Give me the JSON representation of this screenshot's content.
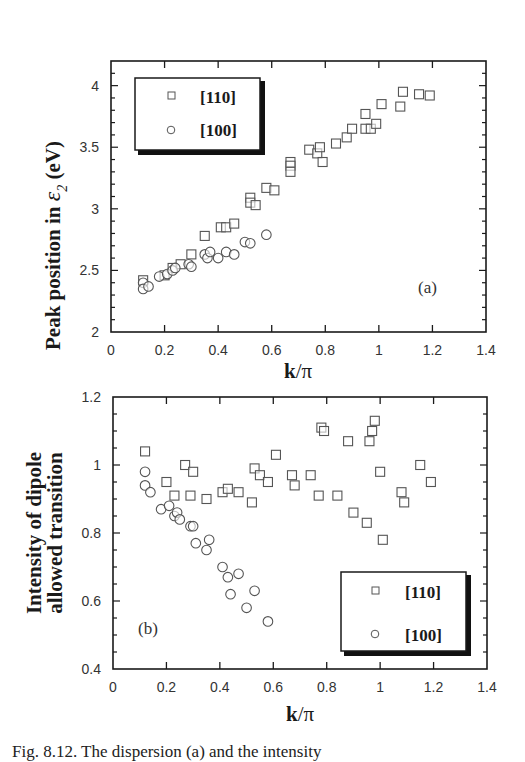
{
  "caption": "Fig. 8.12.  The dispersion (a) and the intensity",
  "colors": {
    "ink": "#1a1a1a",
    "marker": "#555555",
    "background": "#ffffff"
  },
  "chart_data": [
    {
      "panel": "(a)",
      "type": "scatter",
      "title": "",
      "xlabel": "k/π",
      "ylabel": "Peak position in ε2 (eV)",
      "ylabel_parts": {
        "prefix": "Peak position in ",
        "symbol": "ε",
        "subscript": "2",
        "suffix": " (eV)"
      },
      "xlim": [
        0,
        1.4
      ],
      "ylim": [
        2,
        4.2
      ],
      "xticks": [
        "0",
        "0.2",
        "0.4",
        "0.6",
        "0.8",
        "1",
        "1.2",
        "1.4"
      ],
      "yticks": [
        "2",
        "2.5",
        "3",
        "3.5",
        "4"
      ],
      "grid": false,
      "legend_position": "upper left",
      "series": [
        {
          "name": "[110]",
          "marker": "square",
          "x": [
            0.12,
            0.2,
            0.23,
            0.26,
            0.3,
            0.35,
            0.41,
            0.43,
            0.46,
            0.52,
            0.52,
            0.54,
            0.58,
            0.61,
            0.67,
            0.67,
            0.67,
            0.74,
            0.77,
            0.78,
            0.79,
            0.84,
            0.88,
            0.9,
            0.95,
            0.95,
            0.97,
            0.99,
            1.01,
            1.08,
            1.09,
            1.15,
            1.19
          ],
          "y": [
            2.42,
            2.46,
            2.52,
            2.55,
            2.63,
            2.78,
            2.85,
            2.85,
            2.88,
            3.09,
            3.05,
            3.03,
            3.17,
            3.15,
            3.38,
            3.35,
            3.3,
            3.48,
            3.45,
            3.5,
            3.38,
            3.53,
            3.58,
            3.65,
            3.65,
            3.77,
            3.65,
            3.69,
            3.85,
            3.83,
            3.95,
            3.93,
            3.92
          ]
        },
        {
          "name": "[100]",
          "marker": "circle",
          "x": [
            0.12,
            0.12,
            0.14,
            0.18,
            0.21,
            0.23,
            0.24,
            0.29,
            0.3,
            0.35,
            0.36,
            0.37,
            0.4,
            0.43,
            0.46,
            0.5,
            0.52,
            0.58
          ],
          "y": [
            2.4,
            2.35,
            2.37,
            2.45,
            2.47,
            2.5,
            2.52,
            2.55,
            2.53,
            2.63,
            2.6,
            2.65,
            2.6,
            2.65,
            2.63,
            2.73,
            2.72,
            2.79
          ]
        }
      ]
    },
    {
      "panel": "(b)",
      "type": "scatter",
      "title": "",
      "xlabel": "k/π",
      "ylabel": "Intensity of dipole allowed transition",
      "ylabel_lines": [
        "Intensity of dipole",
        "allowed transition"
      ],
      "xlim": [
        0,
        1.4
      ],
      "ylim": [
        0.4,
        1.2
      ],
      "xticks": [
        "0",
        "0.2",
        "0.4",
        "0.6",
        "0.8",
        "1",
        "1.2",
        "1.4"
      ],
      "yticks": [
        "0.4",
        "0.6",
        "0.8",
        "1",
        "1.2"
      ],
      "grid": false,
      "legend_position": "lower right",
      "series": [
        {
          "name": "[110]",
          "marker": "square",
          "x": [
            0.12,
            0.2,
            0.23,
            0.27,
            0.3,
            0.29,
            0.35,
            0.41,
            0.43,
            0.47,
            0.52,
            0.53,
            0.55,
            0.58,
            0.61,
            0.67,
            0.68,
            0.74,
            0.77,
            0.78,
            0.79,
            0.84,
            0.88,
            0.9,
            0.95,
            0.96,
            0.97,
            0.98,
            1.0,
            1.01,
            1.08,
            1.09,
            1.15,
            1.19
          ],
          "y": [
            1.04,
            0.95,
            0.91,
            1.0,
            0.98,
            0.91,
            0.9,
            0.92,
            0.93,
            0.92,
            0.89,
            0.99,
            0.97,
            0.95,
            1.03,
            0.97,
            0.94,
            0.97,
            0.91,
            1.11,
            1.1,
            0.91,
            1.07,
            0.86,
            0.83,
            1.07,
            1.1,
            1.13,
            0.98,
            0.78,
            0.92,
            0.89,
            1.0,
            0.95
          ]
        },
        {
          "name": "[100]",
          "marker": "circle",
          "x": [
            0.12,
            0.12,
            0.14,
            0.18,
            0.21,
            0.23,
            0.24,
            0.25,
            0.29,
            0.3,
            0.31,
            0.35,
            0.36,
            0.41,
            0.43,
            0.44,
            0.47,
            0.5,
            0.53,
            0.58
          ],
          "y": [
            0.98,
            0.94,
            0.92,
            0.87,
            0.88,
            0.85,
            0.86,
            0.84,
            0.82,
            0.82,
            0.77,
            0.75,
            0.78,
            0.7,
            0.67,
            0.62,
            0.68,
            0.58,
            0.63,
            0.54
          ]
        }
      ]
    }
  ]
}
